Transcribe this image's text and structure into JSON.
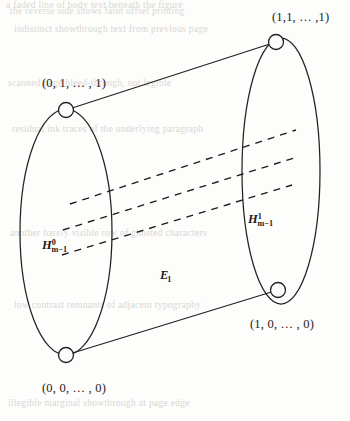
{
  "figure": {
    "type": "cylinder-prism-diagram",
    "caption_present": false,
    "background_ghost_text": [
      "the reverse side shows faint offset printing",
      "indistinct showthrough text from previous page",
      "scanned page bleed-through, not legible",
      "residual ink traces of the underlying paragraph",
      "a faded line of body text beneath the figure",
      "another barely visible row of ghosted characters",
      "low contrast remnants of adjacent typography",
      "illegible marginal showthrough at page edge"
    ],
    "vertices": [
      {
        "id": "top-left",
        "label": "(0, 1, … , 1)",
        "cx": 66,
        "cy": 110,
        "r": 7.5,
        "label_x": 42,
        "label_y": 76
      },
      {
        "id": "top-right",
        "label": "(1,1, … ,1)",
        "cx": 276,
        "cy": 42,
        "r": 7.5,
        "label_x": 272,
        "label_y": 10
      },
      {
        "id": "bottom-left",
        "label": "(0, 0, … , 0)",
        "cx": 66,
        "cy": 355,
        "r": 7.5,
        "label_x": 42,
        "label_y": 381
      },
      {
        "id": "bottom-right",
        "label": "(1, 0, … , 0)",
        "cx": 278,
        "cy": 290,
        "r": 7.5,
        "label_x": 250,
        "label_y": 317
      }
    ],
    "faces": [
      {
        "id": "left-face",
        "name": "left-ellipse",
        "label_base": "H",
        "label_sup": "0",
        "label_sub": "m−1",
        "label_x": 42,
        "label_y": 238,
        "cx": 66,
        "cy": 232,
        "rx": 46,
        "ry": 123
      },
      {
        "id": "right-face",
        "name": "right-ellipse",
        "label_base": "H",
        "label_sup": "1",
        "label_sub": "m−1",
        "label_x": 248,
        "label_y": 212,
        "cx": 281,
        "cy": 171,
        "rx": 39,
        "ry": 133
      }
    ],
    "body_label": {
      "base": "E",
      "sub": "1",
      "x": 160,
      "y": 268
    },
    "edges": [
      {
        "id": "top-edge",
        "x1": 66,
        "y1": 110,
        "x2": 276,
        "y2": 42
      },
      {
        "id": "bottom-edge",
        "x1": 66,
        "y1": 355,
        "x2": 278,
        "y2": 290
      }
    ],
    "dashed_lines": [
      {
        "id": "dash-1",
        "x1": 70,
        "y1": 204,
        "x2": 296,
        "y2": 130
      },
      {
        "id": "dash-2",
        "x1": 63,
        "y1": 230,
        "x2": 294,
        "y2": 158
      },
      {
        "id": "dash-3",
        "x1": 62,
        "y1": 255,
        "x2": 292,
        "y2": 185
      }
    ],
    "colors": {
      "ink": "#1b1b1b",
      "stroke": "#222222",
      "paper": "#fdfdfc",
      "ghost": "#d9d7d3"
    }
  }
}
